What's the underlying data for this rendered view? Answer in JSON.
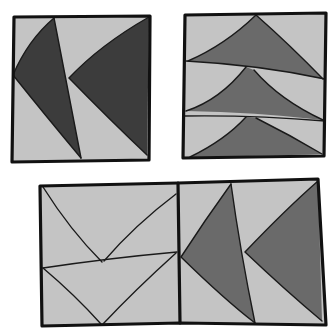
{
  "diagram": {
    "title": "",
    "colors": {
      "background": "#ffffff",
      "light_fabric": "#c4c4c4",
      "dark_fabric": "#3c3c3c",
      "medium_fabric": "#6a6a6a",
      "outline": "#111111"
    },
    "blocks": [
      {
        "id": "top-left",
        "label": "Two sideways geese (dark)",
        "units": 2,
        "orientation": "pointing-left",
        "fill": "dark_fabric"
      },
      {
        "id": "top-right",
        "label": "Three stacked geese (medium)",
        "units": 3,
        "orientation": "pointing-up",
        "fill": "medium_fabric"
      },
      {
        "id": "bottom",
        "label": "Outline-only geese beside sideways geese",
        "left_half": {
          "units": 2,
          "orientation": "pointing-down",
          "fill": "light_fabric"
        },
        "right_half": {
          "units": 2,
          "orientation": "pointing-left",
          "fill": "medium_fabric"
        }
      }
    ]
  }
}
